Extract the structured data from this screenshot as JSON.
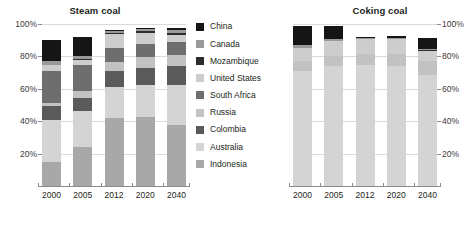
{
  "figure": {
    "background": "#ffffff"
  },
  "legend": {
    "position": "center",
    "entries": [
      {
        "label": "China",
        "color": "#151515"
      },
      {
        "label": "Canada",
        "color": "#9a9a9a"
      },
      {
        "label": "Mozambique",
        "color": "#2d2d2d"
      },
      {
        "label": "United States",
        "color": "#cdcdcd"
      },
      {
        "label": "South Africa",
        "color": "#6e6e6e"
      },
      {
        "label": "Russia",
        "color": "#c2c2c2"
      },
      {
        "label": "Colombia",
        "color": "#5a5a5a"
      },
      {
        "label": "Australia",
        "color": "#d4d4d4"
      },
      {
        "label": "Indonesia",
        "color": "#a8a8a8"
      }
    ]
  },
  "yaxis": {
    "ticks": [
      "20%",
      "40%",
      "60%",
      "80%",
      "100%"
    ],
    "values": [
      20,
      40,
      60,
      80,
      100
    ],
    "min": 0,
    "max": 100
  },
  "xaxis": {
    "ticks": [
      "2000",
      "2005",
      "2012",
      "2020",
      "2040"
    ]
  },
  "panels": [
    {
      "key": "steam",
      "title": "Steam coal",
      "y_label_side": "left"
    },
    {
      "key": "coking",
      "title": "Coking coal",
      "y_label_side": "right"
    }
  ],
  "chart_data": [
    {
      "type": "bar",
      "stacked": true,
      "title": "Steam coal",
      "xlabel": "",
      "ylabel": "",
      "ylim": [
        0,
        100
      ],
      "grid": true,
      "legend_position": "center",
      "categories": [
        "2000",
        "2005",
        "2012",
        "2020",
        "2040"
      ],
      "series": [
        {
          "name": "Indonesia",
          "color": "#a8a8a8",
          "values": [
            15.0,
            24.0,
            42.0,
            42.5,
            37.5
          ]
        },
        {
          "name": "Australia",
          "color": "#d4d4d4",
          "values": [
            25.5,
            22.5,
            19.0,
            20.0,
            25.0
          ]
        },
        {
          "name": "Colombia",
          "color": "#5a5a5a",
          "values": [
            9.0,
            8.0,
            10.0,
            10.5,
            11.5
          ]
        },
        {
          "name": "Russia",
          "color": "#c2c2c2",
          "values": [
            2.0,
            4.0,
            5.5,
            6.5,
            7.0
          ]
        },
        {
          "name": "South Africa",
          "color": "#6e6e6e",
          "values": [
            19.5,
            16.0,
            9.0,
            8.0,
            8.0
          ]
        },
        {
          "name": "United States",
          "color": "#cdcdcd",
          "values": [
            4.0,
            3.5,
            8.5,
            7.0,
            4.0
          ]
        },
        {
          "name": "Mozambique",
          "color": "#2d2d2d",
          "values": [
            0.0,
            0.5,
            0.5,
            1.0,
            1.5
          ]
        },
        {
          "name": "Canada",
          "color": "#9a9a9a",
          "values": [
            2.0,
            2.0,
            1.5,
            1.5,
            2.0
          ]
        },
        {
          "name": "China",
          "color": "#151515",
          "values": [
            13.0,
            11.5,
            0.5,
            0.8,
            1.0
          ]
        }
      ]
    },
    {
      "type": "bar",
      "stacked": true,
      "title": "Coking coal",
      "xlabel": "",
      "ylabel": "",
      "ylim": [
        0,
        100
      ],
      "grid": true,
      "legend_position": "center",
      "categories": [
        "2000",
        "2005",
        "2012",
        "2020",
        "2040"
      ],
      "series": [
        {
          "name": "Indonesia",
          "color": "#a8a8a8",
          "values": [
            0.0,
            0.0,
            0.0,
            0.0,
            0.0
          ]
        },
        {
          "name": "Australia",
          "color": "#d4d4d4",
          "values": [
            71.0,
            74.0,
            74.5,
            74.0,
            68.5
          ]
        },
        {
          "name": "Colombia",
          "color": "#5a5a5a",
          "values": [
            0.0,
            0.0,
            0.0,
            0.0,
            0.0
          ]
        },
        {
          "name": "Russia",
          "color": "#c2c2c2",
          "values": [
            6.0,
            6.5,
            7.0,
            7.5,
            8.5
          ]
        },
        {
          "name": "South Africa",
          "color": "#6e6e6e",
          "values": [
            0.0,
            0.0,
            0.0,
            0.0,
            0.0
          ]
        },
        {
          "name": "United States",
          "color": "#cdcdcd",
          "values": [
            8.5,
            9.0,
            9.0,
            9.0,
            6.5
          ]
        },
        {
          "name": "Mozambique",
          "color": "#2d2d2d",
          "values": [
            0.0,
            0.0,
            0.5,
            0.5,
            0.5
          ]
        },
        {
          "name": "Canada",
          "color": "#9a9a9a",
          "values": [
            1.5,
            1.5,
            0.5,
            0.5,
            0.5
          ]
        },
        {
          "name": "China",
          "color": "#151515",
          "values": [
            12.0,
            8.0,
            0.5,
            1.0,
            7.0
          ]
        }
      ]
    }
  ]
}
